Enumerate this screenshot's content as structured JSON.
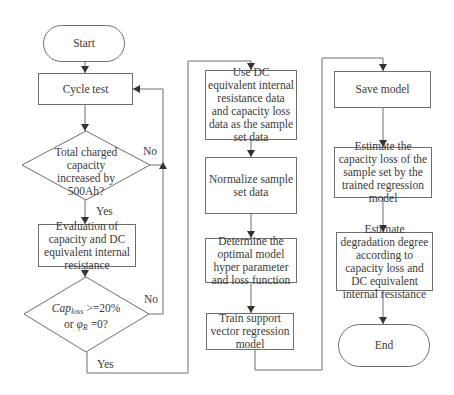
{
  "flowchart": {
    "nodes": {
      "start": "Start",
      "cycle_test": "Cycle test",
      "decision_charged": "Total charged capacity increased by 500Ah?",
      "evaluation": "Evaluation of capacity and DC equivalent internal resistance",
      "decision_cap": {
        "cap": "Cap",
        "cap_sub": "loss",
        "cap_rest": " >=20%",
        "or": "or ",
        "phi": "φ",
        "phi_sub": "R",
        "phi_rest": " =0?"
      },
      "use_dc": "Use DC equivalent internal resistance data and capacity loss data as the sample set data",
      "normalize": "Normalize sample set data",
      "determine": "Determine the optimal model hyper parameter and loss function",
      "train": "Train support vector regression model",
      "save": "Save model",
      "estimate_capacity": "Estimate the capacity loss of the sample set by the trained regression model",
      "estimate_degradation": "Estimate degradation degree according to capacity loss and DC equivalent internal resistance",
      "end": "End"
    },
    "edge_labels": {
      "no_1": "No",
      "yes_1": "Yes",
      "no_2": "No",
      "yes_2": "Yes"
    },
    "colors": {
      "line": "#6e6e6e",
      "text": "#3a3a3a"
    }
  }
}
